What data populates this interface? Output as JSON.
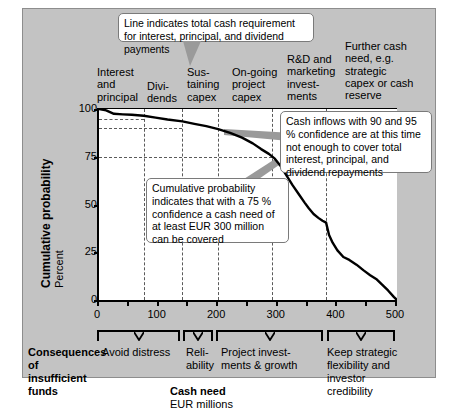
{
  "axes": {
    "y_title": "Cumulative probability",
    "y_subtitle": "Percent",
    "y_ticks": [
      "0",
      "25",
      "50",
      "75",
      "100"
    ],
    "x_ticks": [
      "0",
      "100",
      "200",
      "300",
      "400",
      "500"
    ],
    "x_title": "Cash need",
    "x_subtitle": "EUR millions"
  },
  "top_labels": [
    {
      "text": "Interest\nand\nprincipal"
    },
    {
      "text": "Divi-\ndends"
    },
    {
      "text": "Sus-\ntaining\ncapex"
    },
    {
      "text": "On-going\nproject\ncapex"
    },
    {
      "text": "R&D and\nmarketing\ninvest-\nments"
    },
    {
      "text": "Further cash\nneed, e.g.\nstrategic\ncapex or\ncash reserve"
    }
  ],
  "callouts": {
    "top": "Line indicates total cash requirement for interest, principal, and dividend payments",
    "right": "Cash inflows with 90 and 95 % confidence are at this time not enough to cover total interest, principal, and dividend repayments",
    "middle": "Cumulative probability indicates that with a 75 % confidence a cash need of at least EUR 300 million can be covered"
  },
  "bottom": {
    "section_title": "Consequences of insufficient funds",
    "brackets": [
      {
        "label": "Avoid distress",
        "from": 0,
        "to": 140
      },
      {
        "label": "Reli-\nability",
        "from": 140,
        "to": 200
      },
      {
        "label": "Project invest-\nments & growth",
        "from": 200,
        "to": 380
      },
      {
        "label": "Keep strategic\nflexibility and\ninvestor\ncredibility",
        "from": 380,
        "to": 500
      }
    ]
  },
  "chart_data": {
    "type": "line",
    "title": "",
    "xlabel": "Cash need (EUR millions)",
    "ylabel": "Cumulative probability (Percent)",
    "xlim": [
      0,
      500
    ],
    "ylim": [
      0,
      100
    ],
    "grid": true,
    "legend": "none",
    "x_gridlines": [
      75,
      140,
      200,
      290,
      380
    ],
    "y_gridlines": [
      90,
      95
    ],
    "reference_lines": [
      {
        "value": 95,
        "axis": "y",
        "label": "95 % confidence",
        "extends_to_x": 75
      },
      {
        "value": 90,
        "axis": "y",
        "label": "90 % confidence",
        "extends_to_x": 140
      },
      {
        "value": 75,
        "axis": "y",
        "label": "75 % confidence",
        "extends_to_x": 290
      }
    ],
    "series": [
      {
        "name": "Cumulative probability of cash need",
        "x": [
          0,
          12,
          25,
          40,
          55,
          75,
          95,
          115,
          140,
          160,
          180,
          200,
          220,
          240,
          258,
          272,
          285,
          295,
          305,
          315,
          325,
          335,
          345,
          352,
          360,
          368,
          375,
          381,
          386,
          392,
          400,
          410,
          420,
          432,
          444,
          455,
          465,
          475,
          485,
          495,
          500
        ],
        "y": [
          100,
          99.3,
          97.5,
          97.2,
          97.0,
          96.5,
          95.5,
          94.5,
          93.5,
          92.2,
          91.0,
          89.5,
          87.5,
          85.0,
          82.0,
          79.0,
          76.5,
          74.0,
          70.0,
          65.0,
          60.0,
          55.5,
          51.0,
          48.0,
          45.0,
          43.0,
          41.5,
          40.5,
          34.0,
          30.0,
          26.0,
          22.5,
          21.0,
          18.5,
          15.5,
          13.0,
          11.0,
          8.0,
          5.0,
          1.5,
          0
        ]
      }
    ]
  }
}
